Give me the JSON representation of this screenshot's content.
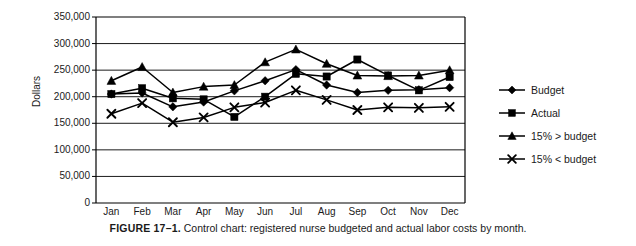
{
  "figure": {
    "caption_label": "FIGURE 17–1.",
    "caption_text": "Control chart: registered nurse budgeted and actual labor costs by month."
  },
  "legend": {
    "position": "right",
    "items": [
      {
        "label": "Budget",
        "marker": "diamond-marker-icon"
      },
      {
        "label": "Actual",
        "marker": "square-marker-icon"
      },
      {
        "label": "15% > budget",
        "marker": "triangle-marker-icon"
      },
      {
        "label": "15% < budget",
        "marker": "x-marker-icon"
      }
    ]
  },
  "colors": {
    "line": "#000000",
    "grid": "#000000",
    "axis": "#000000",
    "background": "#ffffff",
    "text": "#1a1a1a"
  },
  "chart_data": {
    "type": "line",
    "title": "",
    "xlabel": "",
    "ylabel": "Dollars",
    "categories": [
      "Jan",
      "Feb",
      "Mar",
      "Apr",
      "May",
      "Jun",
      "Jul",
      "Aug",
      "Sep",
      "Oct",
      "Nov",
      "Dec"
    ],
    "ylim": [
      0,
      350000
    ],
    "yticks": [
      0,
      50000,
      100000,
      150000,
      200000,
      250000,
      300000,
      350000
    ],
    "ytick_labels": [
      "0",
      "50,000",
      "100,000",
      "150,000",
      "200,000",
      "250,000",
      "300,000",
      "350,000"
    ],
    "grid": true,
    "series": [
      {
        "name": "Budget",
        "marker": "diamond",
        "values": [
          205000,
          207000,
          181000,
          190000,
          211000,
          230000,
          251000,
          222000,
          208000,
          212000,
          213000,
          217000
        ]
      },
      {
        "name": "Actual",
        "marker": "square",
        "values": [
          205000,
          216000,
          197000,
          195000,
          162000,
          200000,
          243000,
          238000,
          270000,
          240000,
          212000,
          237000
        ]
      },
      {
        "name": "15% > budget",
        "marker": "triangle",
        "values": [
          230000,
          256000,
          208000,
          219000,
          222000,
          265000,
          289000,
          262000,
          240000,
          239000,
          240000,
          250000
        ]
      },
      {
        "name": "15% < budget",
        "marker": "x",
        "values": [
          168000,
          188000,
          152000,
          161000,
          180000,
          189000,
          212000,
          194000,
          175000,
          180000,
          179000,
          181000
        ]
      }
    ]
  }
}
